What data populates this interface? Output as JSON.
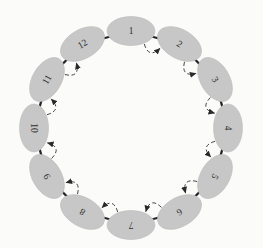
{
  "figure": {
    "type": "ring-diagram",
    "nodes": [
      {
        "id": 1,
        "label": "1",
        "angle": 0,
        "label_rotation": 0
      },
      {
        "id": 2,
        "label": "2",
        "angle": 30,
        "label_rotation": 30
      },
      {
        "id": 3,
        "label": "3",
        "angle": 60,
        "label_rotation": 60
      },
      {
        "id": 4,
        "label": "4",
        "angle": 90,
        "label_rotation": 90
      },
      {
        "id": 5,
        "label": "5",
        "angle": 120,
        "label_rotation": 120
      },
      {
        "id": 6,
        "label": "6",
        "angle": 150,
        "label_rotation": 150
      },
      {
        "id": 7,
        "label": "7",
        "angle": 180,
        "label_rotation": 180
      },
      {
        "id": 8,
        "label": "8",
        "angle": 210,
        "label_rotation": 210
      },
      {
        "id": 9,
        "label": "9",
        "angle": 240,
        "label_rotation": 240
      },
      {
        "id": 10,
        "label": "10",
        "angle": 270,
        "label_rotation": 90
      },
      {
        "id": 11,
        "label": "11",
        "angle": 300,
        "label_rotation": 300
      },
      {
        "id": 12,
        "label": "12",
        "angle": 330,
        "label_rotation": 330
      }
    ],
    "ring_edges": [
      [
        1,
        2
      ],
      [
        2,
        3
      ],
      [
        3,
        4
      ],
      [
        4,
        5
      ],
      [
        5,
        6
      ],
      [
        6,
        7
      ],
      [
        7,
        8
      ],
      [
        8,
        9
      ],
      [
        9,
        10
      ],
      [
        10,
        11
      ],
      [
        11,
        12
      ],
      [
        12,
        1
      ]
    ],
    "dashed_arrows": [
      {
        "from": 1,
        "to": 2
      },
      {
        "from": 2,
        "to": 3
      },
      {
        "from": 3,
        "to": 4
      },
      {
        "from": 4,
        "to": 5
      },
      {
        "from": 5,
        "to": 6
      },
      {
        "from": 6,
        "to": 7
      },
      {
        "from": 7,
        "to": 8
      },
      {
        "from": 8,
        "to": 9
      },
      {
        "from": 9,
        "to": 10
      },
      {
        "from": 10,
        "to": 11
      },
      {
        "from": 11,
        "to": 12
      }
    ],
    "geometry": {
      "width": 263,
      "height": 248,
      "center_x": 131,
      "center_y": 128,
      "ring_radius": 97,
      "node_rx": 24,
      "node_ry": 14.5,
      "arc_start_offset_deg": 9,
      "arc_end_offset_deg": 10,
      "arc_end_radius": 85,
      "arc_ctrl_radius": 71
    },
    "colors": {
      "background": "#fbfbfa",
      "node_fill": "#c7c7c7",
      "node_edge": "#bcbcbc",
      "ring_line": "#242424",
      "dashed_line": "#3a3a3a",
      "arrow": "#2a2a2a",
      "label": "#2f2f2f"
    }
  }
}
